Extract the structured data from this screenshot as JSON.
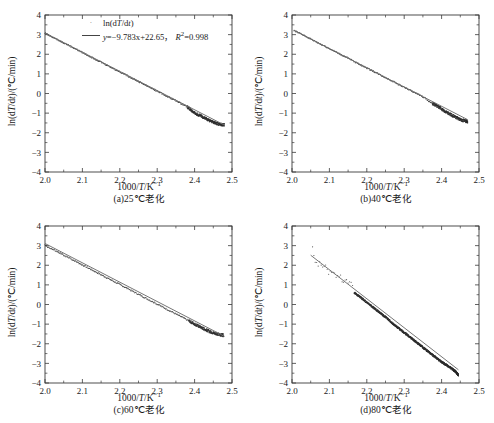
{
  "figure": {
    "panel_count": 4,
    "axis": {
      "xlabel_text": "1000/T/K",
      "xlabel_sup": "-1",
      "ylabel_text": "ln(dT/dt)/(°C/min)",
      "xticks": [
        "2.0",
        "2.1",
        "2.2",
        "2.3",
        "2.4",
        "2.5"
      ],
      "yticks": [
        "4",
        "3",
        "2",
        "1",
        "0",
        "-1",
        "-2",
        "-3",
        "-4"
      ],
      "xlim": [
        2.0,
        2.5
      ],
      "ylim": [
        -4,
        4
      ]
    },
    "colors": {
      "frame": "#3a3a3a",
      "fit_line": "#6f6f6f",
      "data_points": "#2b2b2b",
      "background": "#ffffff"
    }
  },
  "panels": [
    {
      "id": "a",
      "caption": "(a)25℃老化",
      "legend": {
        "series_label": "ln(dT/dt)",
        "fit_prefix": "y=",
        "fit_body": "−9.783x+22.65",
        "fit_sep": "，",
        "r2_label": "R",
        "r2_sup": "2",
        "r2_value": "=0.998"
      },
      "chart_data": {
        "type": "scatter",
        "title": "(a)25℃老化",
        "xlabel": "1000/T/K-1",
        "ylabel": "ln(dT/dt)/(°C/min)",
        "xlim": [
          2.0,
          2.5
        ],
        "ylim": [
          -4,
          4
        ],
        "grid": false,
        "legend_position": "upper-center",
        "fit": {
          "slope": -9.783,
          "intercept": 22.65,
          "r_squared": 0.998,
          "x_from": 2.0,
          "x_to": 2.48
        },
        "series": [
          {
            "name": "ln(dT/dt)",
            "x": [
              2.0,
              2.01,
              2.02,
              2.03,
              2.04,
              2.05,
              2.06,
              2.07,
              2.08,
              2.09,
              2.1,
              2.11,
              2.12,
              2.13,
              2.14,
              2.15,
              2.16,
              2.17,
              2.18,
              2.19,
              2.2,
              2.21,
              2.22,
              2.23,
              2.24,
              2.25,
              2.26,
              2.27,
              2.28,
              2.29,
              2.3,
              2.31,
              2.32,
              2.33,
              2.34,
              2.35,
              2.36,
              2.37,
              2.38,
              2.39,
              2.4,
              2.41,
              2.42,
              2.43,
              2.44,
              2.45,
              2.46,
              2.47,
              2.48
            ],
            "y": [
              3.08,
              2.98,
              2.88,
              2.78,
              2.68,
              2.59,
              2.49,
              2.39,
              2.29,
              2.19,
              2.09,
              1.99,
              1.89,
              1.8,
              1.7,
              1.6,
              1.5,
              1.4,
              1.3,
              1.2,
              1.11,
              1.01,
              0.91,
              0.81,
              0.71,
              0.61,
              0.51,
              0.42,
              0.32,
              0.22,
              0.12,
              0.02,
              -0.08,
              -0.18,
              -0.27,
              -0.37,
              -0.47,
              -0.57,
              -0.67,
              -0.83,
              -1.0,
              -1.08,
              -1.18,
              -1.28,
              -1.38,
              -1.46,
              -1.54,
              -1.58,
              -1.6
            ]
          }
        ]
      }
    },
    {
      "id": "b",
      "caption": "(b)40℃老化",
      "legend": {
        "series_label": "ln(dT/dt)",
        "fit_prefix": "y=",
        "fit_body": "−9.80x+22.87",
        "fit_sep": "，",
        "r2_label": "R",
        "r2_sup": "2",
        "r2_value": "=0.999"
      },
      "chart_data": {
        "type": "scatter",
        "title": "(b)40℃老化",
        "xlabel": "1000/T/K-1",
        "ylabel": "ln(dT/dt)/(°C/min)",
        "xlim": [
          2.0,
          2.5
        ],
        "ylim": [
          -4,
          4
        ],
        "grid": false,
        "legend_position": "upper-center",
        "fit": {
          "slope": -9.8,
          "intercept": 22.87,
          "r_squared": 0.999,
          "x_from": 2.005,
          "x_to": 2.47
        },
        "series": [
          {
            "name": "ln(dT/dt)",
            "x": [
              2.005,
              2.015,
              2.025,
              2.035,
              2.045,
              2.055,
              2.065,
              2.075,
              2.085,
              2.095,
              2.105,
              2.115,
              2.125,
              2.135,
              2.145,
              2.155,
              2.165,
              2.175,
              2.185,
              2.195,
              2.205,
              2.215,
              2.225,
              2.235,
              2.245,
              2.255,
              2.265,
              2.275,
              2.285,
              2.295,
              2.305,
              2.315,
              2.325,
              2.335,
              2.345,
              2.355,
              2.365,
              2.375,
              2.385,
              2.395,
              2.405,
              2.415,
              2.425,
              2.435,
              2.445,
              2.455,
              2.465,
              2.47
            ],
            "y": [
              3.22,
              3.12,
              3.03,
              2.93,
              2.83,
              2.73,
              2.63,
              2.53,
              2.44,
              2.34,
              2.24,
              2.14,
              2.04,
              1.94,
              1.85,
              1.75,
              1.65,
              1.55,
              1.45,
              1.35,
              1.26,
              1.16,
              1.06,
              0.96,
              0.86,
              0.76,
              0.67,
              0.57,
              0.47,
              0.37,
              0.27,
              0.17,
              0.08,
              -0.02,
              -0.12,
              -0.22,
              -0.38,
              -0.5,
              -0.6,
              -0.72,
              -0.86,
              -0.98,
              -1.08,
              -1.18,
              -1.28,
              -1.36,
              -1.41,
              -1.43
            ]
          }
        ]
      }
    },
    {
      "id": "c",
      "caption": "(c)60℃老化",
      "legend": {
        "series_label": "ln(dT/dt)",
        "fit_prefix": "y=",
        "fit_body": "−9.86x+22.83",
        "fit_sep": "，",
        "r2_label": "R",
        "r2_sup": "2",
        "r2_value": "=0.993"
      },
      "chart_data": {
        "type": "scatter",
        "title": "(c)60℃老化",
        "xlabel": "1000/T/K-1",
        "ylabel": "ln(dT/dt)/(°C/min)",
        "xlim": [
          2.0,
          2.5
        ],
        "ylim": [
          -4,
          4
        ],
        "grid": false,
        "legend_position": "upper-center",
        "fit": {
          "slope": -9.86,
          "intercept": 22.83,
          "r_squared": 0.993,
          "x_from": 2.0,
          "x_to": 2.48
        },
        "series": [
          {
            "name": "ln(dT/dt)",
            "x": [
              2.0,
              2.012,
              2.024,
              2.036,
              2.048,
              2.06,
              2.072,
              2.084,
              2.096,
              2.108,
              2.12,
              2.132,
              2.144,
              2.156,
              2.168,
              2.18,
              2.192,
              2.204,
              2.216,
              2.228,
              2.24,
              2.252,
              2.264,
              2.276,
              2.288,
              2.3,
              2.312,
              2.324,
              2.336,
              2.348,
              2.36,
              2.372,
              2.384,
              2.396,
              2.408,
              2.42,
              2.432,
              2.444,
              2.456,
              2.468,
              2.478
            ],
            "y": [
              3.01,
              2.89,
              2.77,
              2.65,
              2.53,
              2.41,
              2.3,
              2.18,
              2.06,
              1.94,
              1.82,
              1.7,
              1.58,
              1.46,
              1.34,
              1.22,
              1.1,
              0.98,
              0.86,
              0.74,
              0.62,
              0.5,
              0.38,
              0.26,
              0.14,
              0.02,
              -0.1,
              -0.22,
              -0.34,
              -0.46,
              -0.58,
              -0.7,
              -0.82,
              -0.95,
              -1.07,
              -1.19,
              -1.31,
              -1.4,
              -1.48,
              -1.54,
              -1.57
            ]
          }
        ]
      }
    },
    {
      "id": "d",
      "caption": "(d)80℃老化",
      "legend": {
        "series_label": "ln(dT/dt)",
        "fit_prefix": "y=",
        "fit_body": "−14.78x+32.81",
        "fit_sep": ",",
        "r2_label": "R",
        "r2_sup": "2",
        "r2_value": "=0.995"
      },
      "chart_data": {
        "type": "scatter",
        "title": "(d)80℃老化",
        "xlabel": "1000/T/K-1",
        "ylabel": "ln(dT/dt)/(°C/min)",
        "xlim": [
          2.0,
          2.5
        ],
        "ylim": [
          -4,
          4
        ],
        "grid": false,
        "legend_position": "upper-center",
        "fit": {
          "slope": -14.78,
          "intercept": 32.81,
          "r_squared": 0.995,
          "x_from": 2.05,
          "x_to": 2.445
        },
        "series": [
          {
            "name": "ln(dT/dt)",
            "x": [
              2.055,
              2.062,
              2.07,
              2.078,
              2.086,
              2.094,
              2.102,
              2.11,
              2.118,
              2.126,
              2.134,
              2.142,
              2.15,
              2.158,
              2.166,
              2.174,
              2.182,
              2.19,
              2.198,
              2.206,
              2.214,
              2.222,
              2.23,
              2.238,
              2.246,
              2.254,
              2.262,
              2.27,
              2.278,
              2.286,
              2.294,
              2.302,
              2.31,
              2.318,
              2.326,
              2.334,
              2.342,
              2.35,
              2.358,
              2.366,
              2.374,
              2.382,
              2.39,
              2.398,
              2.406,
              2.414,
              2.422,
              2.43,
              2.436,
              2.44,
              2.443,
              2.445
            ],
            "y": [
              2.84,
              2.3,
              2.07,
              1.98,
              2.05,
              1.72,
              1.64,
              1.78,
              1.48,
              1.42,
              1.3,
              1.12,
              1.18,
              1.14,
              0.62,
              0.5,
              0.38,
              0.26,
              0.14,
              0.02,
              -0.1,
              -0.22,
              -0.34,
              -0.46,
              -0.58,
              -0.7,
              -0.84,
              -0.98,
              -1.1,
              -1.22,
              -1.34,
              -1.46,
              -1.58,
              -1.7,
              -1.82,
              -1.94,
              -2.06,
              -2.18,
              -2.3,
              -2.42,
              -2.54,
              -2.66,
              -2.78,
              -2.9,
              -3.0,
              -3.1,
              -3.2,
              -3.3,
              -3.4,
              -3.48,
              -3.54,
              -3.6
            ]
          }
        ]
      }
    }
  ]
}
